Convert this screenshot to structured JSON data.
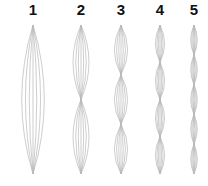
{
  "diagram": {
    "top_y": 25,
    "bottom_y": 174,
    "line_color": "#b8b8b8",
    "columns": [
      {
        "label": "1",
        "center_x": 33,
        "lobes": 1,
        "half_width": 17
      },
      {
        "label": "2",
        "center_x": 81,
        "lobes": 2,
        "half_width": 12
      },
      {
        "label": "3",
        "center_x": 121,
        "lobes": 3,
        "half_width": 10
      },
      {
        "label": "4",
        "center_x": 160,
        "lobes": 4,
        "half_width": 7
      },
      {
        "label": "5",
        "center_x": 194,
        "lobes": 5,
        "half_width": 5
      }
    ],
    "curves_per_side": 3
  }
}
